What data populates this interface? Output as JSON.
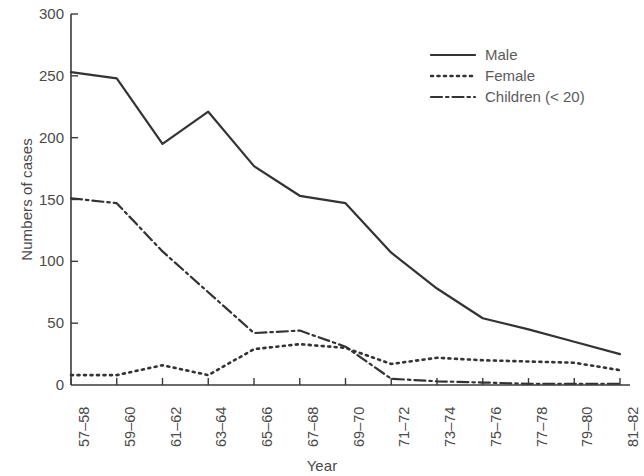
{
  "chart_data": {
    "type": "line",
    "title": "",
    "xlabel": "Year",
    "ylabel": "Numbers of cases",
    "categories": [
      "57–58",
      "59–60",
      "61–62",
      "63–64",
      "65–66",
      "67–68",
      "69–70",
      "71–72",
      "73–74",
      "75–76",
      "77–78",
      "79–80",
      "81–82"
    ],
    "ylim": [
      0,
      300
    ],
    "yticks": [
      0,
      50,
      100,
      150,
      200,
      250,
      300
    ],
    "xlim_categories": 13,
    "grid": false,
    "legend_position": "top-right",
    "series": [
      {
        "name": "Male",
        "style": "solid",
        "color": "#333333",
        "values": [
          253,
          248,
          195,
          221,
          177,
          153,
          147,
          107,
          78,
          54,
          45,
          35,
          25
        ]
      },
      {
        "name": "Female",
        "style": "dotted",
        "color": "#333333",
        "values": [
          8,
          8,
          16,
          8,
          29,
          33,
          30,
          17,
          22,
          20,
          19,
          18,
          12
        ]
      },
      {
        "name": "Children (< 20)",
        "style": "dashdot",
        "color": "#333333",
        "values": [
          151,
          147,
          108,
          75,
          42,
          44,
          31,
          5,
          3,
          2,
          1,
          1,
          1
        ]
      }
    ]
  },
  "legend": {
    "items": [
      {
        "label": "Male",
        "key": "solid-line-key"
      },
      {
        "label": "Female",
        "key": "dotted-line-key"
      },
      {
        "label": "Children (< 20)",
        "key": "dashdot-line-key"
      }
    ]
  }
}
